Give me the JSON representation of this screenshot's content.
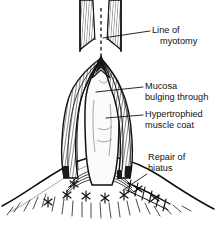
{
  "figure": {
    "background_color": "#ffffff",
    "ink_color": "#111111",
    "width": 222,
    "height": 225
  },
  "labels": [
    {
      "id": "line-of-myotomy",
      "line1": "Line of",
      "line2": "myotomy",
      "text_x": 152,
      "text_y1": 33,
      "text_y2": 44,
      "leader": "M 150,31 L 103,38"
    },
    {
      "id": "mucosa-bulging-through",
      "line1": "Mucosa",
      "line2": "bulging through",
      "text_x": 145,
      "text_y1": 89,
      "text_y2": 100,
      "leader": "M 143,87 L 96,92"
    },
    {
      "id": "hypertrophied-muscle-coat",
      "line1": "Hypertrophied",
      "line2": "muscle coat",
      "text_x": 145,
      "text_y1": 117,
      "text_y2": 128,
      "leader": "M 143,115 L 106,118"
    },
    {
      "id": "repair-of-hiatus",
      "line1": "Repair of",
      "line2": "hiatus",
      "text_x": 148,
      "text_y1": 160,
      "text_y2": 171,
      "leader": "M 147,174 L 123,190"
    }
  ],
  "anatomy": {
    "esophagus": {
      "name": "esophagus-tube",
      "left_edge_x": 80,
      "right_edge_x": 121,
      "top_y": 0,
      "apex_y": 58
    },
    "myotomy_dashed_line": {
      "name": "myotomy-dashed-line",
      "x": 101,
      "from_y": 8,
      "to_y": 56
    },
    "mucosa": {
      "name": "mucosa-bulge",
      "description": "pale bulging mucosal tube through muscle split"
    },
    "muscle_coat": {
      "name": "hypertrophied-muscle-coat",
      "description": "split thickened muscle flaps retracted laterally, hatched shading"
    },
    "diaphragm": {
      "name": "diaphragm-dome",
      "description": "dome with radiating hatch lines below"
    },
    "sutures": {
      "name": "hiatal-repair-sutures",
      "knot_count": 8,
      "description": "X-shaped interrupted suture knots around hiatus"
    }
  }
}
